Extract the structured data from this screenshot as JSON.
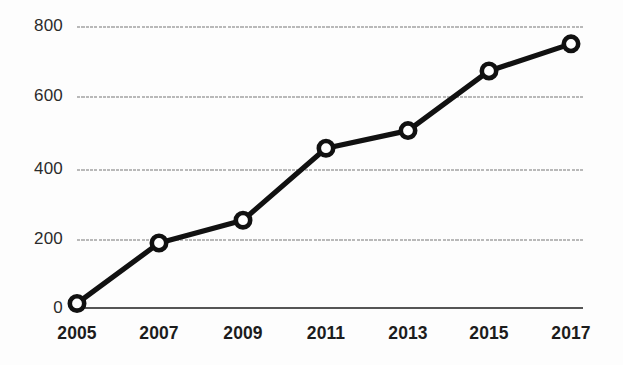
{
  "chart_data": {
    "type": "line",
    "title": "",
    "subtitle": "",
    "xlabel": "",
    "ylabel": "",
    "categories": [
      "2005",
      "2007",
      "2009",
      "2011",
      "2013",
      "2015",
      "2017"
    ],
    "x": [
      2005,
      2007,
      2009,
      2011,
      2013,
      2015,
      2017
    ],
    "values": [
      13,
      185,
      250,
      455,
      505,
      675,
      752
    ],
    "series": [
      {
        "name": "",
        "values": [
          13,
          185,
          250,
          455,
          505,
          675,
          752
        ]
      }
    ],
    "ylim": [
      0,
      800
    ],
    "yticks": [
      0,
      200,
      400,
      600,
      800
    ],
    "ytick_labels": [
      "0",
      "200",
      "400",
      "600",
      "800"
    ],
    "xtick_labels": [
      "2005",
      "2007",
      "2009",
      "2011",
      "2013",
      "2015",
      "2017"
    ],
    "grid": true,
    "grid_axis": "y",
    "legend": false,
    "legend_position": "none",
    "marker": "circle-open",
    "annotations": []
  },
  "style": {
    "line_color": "#111111",
    "marker_fill": "#ffffff",
    "marker_stroke": "#111111",
    "grid_color": "#b9b9b9",
    "axis_color": "#555555",
    "tick_label_color": "#2b2b2b",
    "xtick_label_color": "#1c1c1c",
    "background": "#fdfdfd"
  },
  "axis": {
    "y_labels": [
      "800",
      "600",
      "400",
      "200",
      "0"
    ],
    "x_labels": [
      "2005",
      "2007",
      "2009",
      "2011",
      "2013",
      "2015",
      "2017"
    ]
  }
}
